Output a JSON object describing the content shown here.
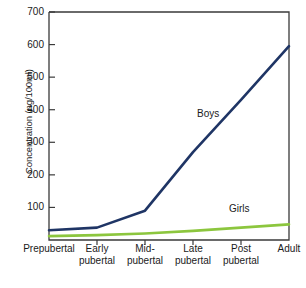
{
  "chart_data": {
    "type": "line",
    "title": "",
    "xlabel": "",
    "ylabel": "Concentration (ng/100ml)",
    "ylim": [
      0,
      700
    ],
    "yticks": [
      100,
      200,
      300,
      400,
      500,
      600,
      700
    ],
    "ytick_labels": [
      "100",
      "200",
      "300",
      "400",
      "500",
      "600",
      "700"
    ],
    "grid": false,
    "legend_position": "inline-annotation",
    "categories": [
      "Prepubertal",
      "Early\npubertal",
      "Mid-\npubertal",
      "Late\npubertal",
      "Post\npubertal",
      "Adult"
    ],
    "series": [
      {
        "name": "Boys",
        "color": "#1f3565",
        "values": [
          30,
          38,
          90,
          270,
          430,
          595
        ]
      },
      {
        "name": "Girls",
        "color": "#8cc63e",
        "values": [
          12,
          15,
          20,
          28,
          38,
          48
        ]
      }
    ],
    "annotations": [
      {
        "text": "Boys",
        "x_category": "Late pubertal",
        "value": 330
      },
      {
        "text": "Girls",
        "x_category": "Post pubertal",
        "value": 105
      }
    ]
  },
  "axis": {
    "frame_color": "#3a3a3a",
    "tick_color": "#3a3a3a"
  }
}
